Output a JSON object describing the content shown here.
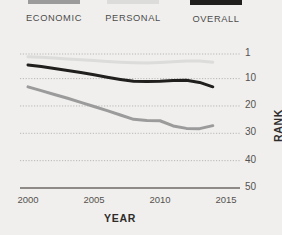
{
  "legend": {
    "items": [
      {
        "label": "ECONOMIC",
        "color": "#9b9b9b"
      },
      {
        "label": "PERSONAL",
        "color": "#dcdcda"
      },
      {
        "label": "OVERALL",
        "color": "#211f1e"
      }
    ]
  },
  "axes": {
    "y_title": "RANK",
    "x_title": "YEAR",
    "y_ticks": [
      "1",
      "10",
      "20",
      "30",
      "40",
      "50"
    ],
    "x_ticks": [
      "2000",
      "2005",
      "2010",
      "2015"
    ]
  },
  "chart_data": {
    "type": "line",
    "title": "",
    "xlabel": "YEAR",
    "ylabel": "RANK",
    "xlim": [
      2000,
      2015
    ],
    "ylim": [
      1,
      50
    ],
    "y_inverted": true,
    "y_ticks": [
      1,
      10,
      20,
      30,
      40,
      50
    ],
    "x_ticks": [
      2000,
      2005,
      2010,
      2015
    ],
    "grid": "horizontal-dotted",
    "legend_position": "top",
    "x": [
      2000,
      2001,
      2002,
      2003,
      2004,
      2005,
      2006,
      2007,
      2008,
      2009,
      2010,
      2011,
      2012,
      2013,
      2014
    ],
    "series": [
      {
        "name": "OVERALL",
        "color": "#211f1e",
        "width": 3.0,
        "values": [
          5,
          5.6,
          6.3,
          7.0,
          7.8,
          8.6,
          9.5,
          10.3,
          11.0,
          11.1,
          11.0,
          10.7,
          10.6,
          11.4,
          13.0
        ]
      },
      {
        "name": "ECONOMIC",
        "color": "#9b9b9b",
        "width": 3.0,
        "values": [
          13,
          14.4,
          15.8,
          17.2,
          18.7,
          20.2,
          21.7,
          23.3,
          24.9,
          25.3,
          25.4,
          27.3,
          28.2,
          28.3,
          27.2
        ]
      },
      {
        "name": "PERSONAL",
        "color": "#dcdcda",
        "width": 3.0,
        "values": [
          2.0,
          2.2,
          2.5,
          2.8,
          3.1,
          3.4,
          3.7,
          4.0,
          4.2,
          4.3,
          4.1,
          3.8,
          3.6,
          3.6,
          4.0
        ]
      }
    ]
  },
  "style": {
    "background": "#f0efed",
    "grid_color": "#b9b7b4",
    "axis_color": "#8d8a87",
    "tick_text_color": "#55524f",
    "title_color": "#2e2c2a"
  }
}
